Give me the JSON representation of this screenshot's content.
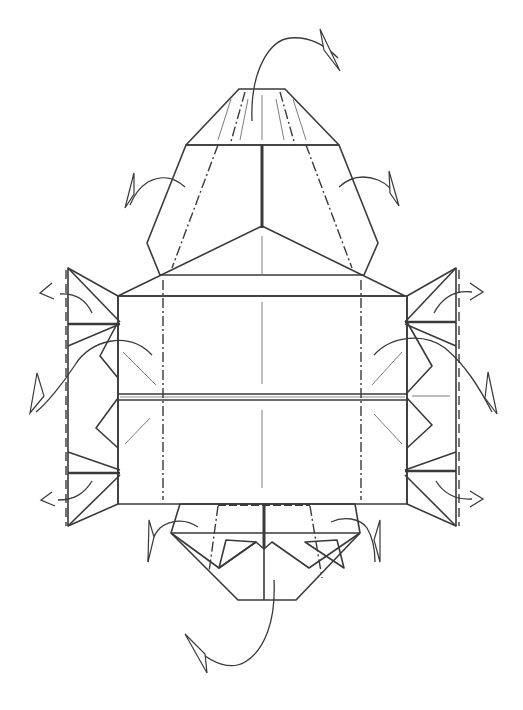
{
  "diagram": {
    "type": "origami-fold-diagram",
    "description": "Origami folding step: symmetric model with upper hood, central rectangular body with horizontal center pleat, side zigzag flaps, and lower hood; arrows indicate folding flaps behind",
    "colors": {
      "background": "#ffffff",
      "paper_front": "#c9c9c9",
      "paper_back": "#ececec",
      "paper_mid": "#d6d6d6",
      "line": "#3a3a3a"
    },
    "regions": [
      {
        "id": "top-cap",
        "label": "top trapezoid cap",
        "shade": "paper_front"
      },
      {
        "id": "upper-hood",
        "label": "upper hood flaps",
        "shade": "paper_back"
      },
      {
        "id": "upper-triangle",
        "label": "upper pointed panel",
        "shade": "paper_mid"
      },
      {
        "id": "center-body",
        "label": "central rectangular body",
        "shade": "paper_front"
      },
      {
        "id": "left-flaps",
        "label": "left zigzag side flaps",
        "shade": "paper_back"
      },
      {
        "id": "right-flaps",
        "label": "right zigzag side flaps",
        "shade": "paper_back"
      },
      {
        "id": "lower-hood",
        "label": "lower hood",
        "shade": "paper_back"
      }
    ],
    "fold_lines": {
      "valley_folds": 6,
      "mountain_folds": 6
    },
    "arrows": [
      {
        "id": "top-arrow",
        "direction": "fold-behind",
        "position": "top"
      },
      {
        "id": "upper-left-arrow",
        "direction": "fold-behind",
        "position": "upper-left"
      },
      {
        "id": "upper-right-arrow",
        "direction": "fold-behind",
        "position": "upper-right"
      },
      {
        "id": "left-top-arrow",
        "direction": "pull-out",
        "position": "left-top"
      },
      {
        "id": "left-mid-arrow",
        "direction": "fold-behind",
        "position": "left-middle"
      },
      {
        "id": "left-bottom-arrow",
        "direction": "pull-out",
        "position": "left-bottom"
      },
      {
        "id": "right-top-arrow",
        "direction": "pull-out",
        "position": "right-top"
      },
      {
        "id": "right-mid-arrow",
        "direction": "fold-behind",
        "position": "right-middle"
      },
      {
        "id": "right-bottom-arrow",
        "direction": "pull-out",
        "position": "right-bottom"
      },
      {
        "id": "lower-left-arrow",
        "direction": "fold-behind",
        "position": "lower-left"
      },
      {
        "id": "lower-right-arrow",
        "direction": "fold-behind",
        "position": "lower-right"
      },
      {
        "id": "bottom-arrow",
        "direction": "fold-behind",
        "position": "bottom"
      }
    ]
  }
}
